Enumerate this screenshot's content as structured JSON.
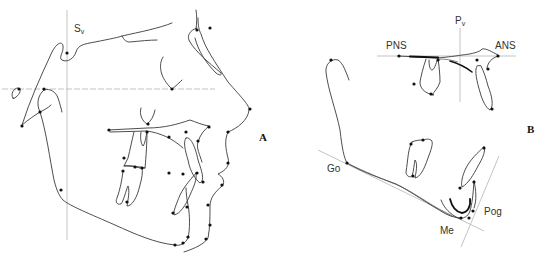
{
  "figure": {
    "panels": [
      {
        "id": "A",
        "label": "A",
        "description": "Lateral cephalometric tracing of soft and hard tissue profile with landmark points",
        "reference_lines": [
          "Sv vertical",
          "horizontal reference"
        ],
        "labels": {
          "sv_main": "S",
          "sv_sub": "v"
        }
      },
      {
        "id": "B",
        "label": "B",
        "description": "Tracing of maxilla and mandible with palatal plane and mandibular plane",
        "reference_lines": [
          "Pv vertical",
          "palatal plane",
          "mandibular plane",
          "facial line"
        ],
        "labels": {
          "pv_main": "P",
          "pv_sub": "v",
          "pns": "PNS",
          "ans": "ANS",
          "go": "Go",
          "me": "Me",
          "pog": "Pog"
        }
      }
    ]
  }
}
